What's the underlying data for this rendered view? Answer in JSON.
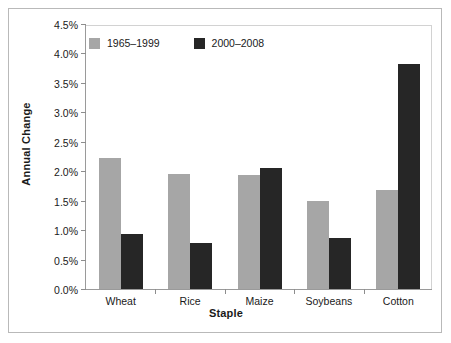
{
  "chart_data": {
    "type": "bar",
    "title": "",
    "xlabel": "Staple",
    "ylabel": "Annual Change",
    "categories": [
      "Wheat",
      "Rice",
      "Maize",
      "Soybeans",
      "Cotton"
    ],
    "series": [
      {
        "name": "1965–1999",
        "color": "#a6a6a6",
        "values": [
          2.22,
          1.95,
          1.93,
          1.5,
          1.68
        ]
      },
      {
        "name": "2000–2008",
        "color": "#262626",
        "values": [
          0.93,
          0.78,
          2.05,
          0.87,
          3.82
        ]
      }
    ],
    "ylim": [
      0.0,
      4.5
    ],
    "ytick_values": [
      0.0,
      0.5,
      1.0,
      1.5,
      2.0,
      2.5,
      3.0,
      3.5,
      4.0,
      4.5
    ],
    "ytick_labels": [
      "0.0%",
      "0.5%",
      "1.0%",
      "1.5%",
      "2.0%",
      "2.5%",
      "3.0%",
      "3.5%",
      "4.0%",
      "4.5%"
    ],
    "grid": false,
    "legend_position": "top-left",
    "value_format": "percent"
  },
  "figure": {
    "border_color": "#b9b9b9",
    "axis_color": "#9a9a9a",
    "background": "#ffffff"
  }
}
